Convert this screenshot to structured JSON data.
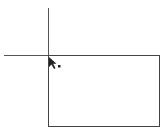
{
  "canvas": {
    "background": "#ffffff",
    "line_color": "#555555",
    "guides": {
      "vertical": {
        "x": 48,
        "y1": 8,
        "y2": 55
      },
      "horizontal": {
        "y": 55,
        "x1": 4,
        "x2": 48
      }
    },
    "rectangle": {
      "x": 48,
      "y": 55,
      "width": 112,
      "height": 72
    }
  },
  "cursor": {
    "icon": "arrow-pointer-with-dot-icon",
    "x": 48,
    "y": 56
  }
}
